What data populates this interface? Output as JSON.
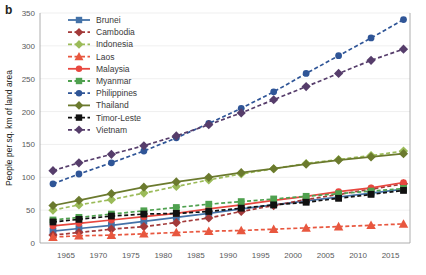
{
  "panel": {
    "label": "b"
  },
  "axes": {
    "ylabel": "People per sq. km of land area",
    "yticks": [
      0,
      50,
      100,
      150,
      200,
      250,
      300,
      350
    ],
    "ylim": [
      0,
      350
    ],
    "xticks": [
      1965,
      1970,
      1975,
      1980,
      1985,
      1990,
      1995,
      2000,
      2005,
      2010,
      2015
    ],
    "xlim": [
      1961,
      2018
    ],
    "grid": "horizontal"
  },
  "chart_data": {
    "type": "line",
    "title": "",
    "xlabel": "",
    "ylabel": "People per sq. km of land area",
    "ylim": [
      0,
      350
    ],
    "xlim": [
      1961,
      2018
    ],
    "legend_position": "upper-left",
    "x": [
      1963,
      1967,
      1972,
      1977,
      1982,
      1987,
      1992,
      1997,
      2002,
      2007,
      2012,
      2017
    ],
    "series": [
      {
        "name": "Brunei",
        "color": "#4472a8",
        "marker": "square",
        "dash": "solid",
        "values": [
          18,
          22,
          27,
          33,
          39,
          45,
          52,
          58,
          64,
          70,
          76,
          82
        ]
      },
      {
        "name": "Cambodia",
        "color": "#a33a3a",
        "marker": "diamond",
        "dash": "dashed",
        "values": [
          12,
          16,
          21,
          25,
          31,
          38,
          48,
          57,
          66,
          74,
          82,
          90
        ]
      },
      {
        "name": "Indonesia",
        "color": "#9bbb59",
        "marker": "diamond",
        "dash": "dashed",
        "values": [
          50,
          58,
          66,
          76,
          86,
          96,
          105,
          113,
          121,
          127,
          133,
          140
        ]
      },
      {
        "name": "Laos",
        "color": "#e8573f",
        "marker": "triangle",
        "dash": "dashed",
        "values": [
          9,
          11,
          12,
          14,
          16,
          18,
          19,
          21,
          23,
          25,
          27,
          29
        ]
      },
      {
        "name": "Malaysia",
        "color": "#e8473f",
        "marker": "circle",
        "dash": "solid",
        "values": [
          26,
          30,
          35,
          40,
          45,
          52,
          58,
          65,
          71,
          78,
          84,
          92
        ]
      },
      {
        "name": "Myanmar",
        "color": "#4fa14f",
        "marker": "square",
        "dash": "dashed",
        "values": [
          35,
          39,
          44,
          49,
          54,
          59,
          63,
          67,
          71,
          75,
          79,
          83
        ]
      },
      {
        "name": "Philippines",
        "color": "#2f5597",
        "marker": "circle",
        "dash": "dashed",
        "values": [
          90,
          105,
          122,
          140,
          160,
          182,
          205,
          230,
          258,
          285,
          312,
          340
        ]
      },
      {
        "name": "Thailand",
        "color": "#6b7a2e",
        "marker": "diamond",
        "dash": "solid",
        "values": [
          57,
          65,
          75,
          85,
          93,
          100,
          107,
          113,
          120,
          126,
          131,
          136
        ]
      },
      {
        "name": "Timor-Leste",
        "color": "#111111",
        "marker": "square",
        "dash": "dashed",
        "values": [
          32,
          36,
          41,
          44,
          45,
          48,
          53,
          58,
          62,
          68,
          74,
          80
        ]
      },
      {
        "name": "Vietnam",
        "color": "#563d6b",
        "marker": "diamond",
        "dash": "dashed",
        "values": [
          110,
          122,
          135,
          148,
          163,
          180,
          198,
          218,
          238,
          258,
          278,
          295
        ]
      }
    ]
  },
  "legend": {
    "items": [
      {
        "label": "Brunei"
      },
      {
        "label": "Cambodia"
      },
      {
        "label": "Indonesia"
      },
      {
        "label": "Laos"
      },
      {
        "label": "Malaysia"
      },
      {
        "label": "Myanmar"
      },
      {
        "label": "Philippines"
      },
      {
        "label": "Thailand"
      },
      {
        "label": "Timor-Leste"
      },
      {
        "label": "Vietnam"
      }
    ]
  }
}
